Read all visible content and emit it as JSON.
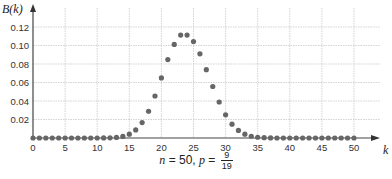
{
  "chart_data": {
    "type": "scatter",
    "title": "",
    "xlabel": "k",
    "ylabel": "B(k)",
    "caption": {
      "n_label": "n",
      "n_value": "= 50,",
      "p_label": "p",
      "p_eq": "=",
      "p_num": "9",
      "p_den": "19"
    },
    "xlim": [
      0,
      50
    ],
    "ylim": [
      0,
      0.12
    ],
    "grid": true,
    "x_ticks": [
      0,
      5,
      10,
      15,
      20,
      25,
      30,
      35,
      40,
      45,
      50
    ],
    "y_ticks": [
      0.02,
      0.04,
      0.06,
      0.08,
      0.1,
      0.12
    ],
    "y_tick_labels": [
      "0.02",
      "0.04",
      "0.06",
      "0.08",
      "0.10",
      "0.12"
    ],
    "series": [
      {
        "name": "Binomial B(k), n=50, p=9/19",
        "color": "#666666",
        "x": [
          0,
          1,
          2,
          3,
          4,
          5,
          6,
          7,
          8,
          9,
          10,
          11,
          12,
          13,
          14,
          15,
          16,
          17,
          18,
          19,
          20,
          21,
          22,
          23,
          24,
          25,
          26,
          27,
          28,
          29,
          30,
          31,
          32,
          33,
          34,
          35,
          36,
          37,
          38,
          39,
          40,
          41,
          42,
          43,
          44,
          45,
          46,
          47,
          48,
          49,
          50
        ],
        "values": [
          0,
          0,
          0,
          0,
          0,
          0,
          0,
          0,
          0,
          0,
          0,
          0.0001,
          0.0002,
          0.0006,
          0.0017,
          0.0041,
          0.0087,
          0.0167,
          0.0289,
          0.0454,
          0.065,
          0.0848,
          0.1012,
          0.1113,
          0.1113,
          0.1042,
          0.091,
          0.0739,
          0.0557,
          0.0389,
          0.0251,
          0.0149,
          0.0082,
          0.0041,
          0.0019,
          0.0008,
          0.0003,
          0.0001,
          0,
          0,
          0,
          0,
          0,
          0,
          0,
          0,
          0,
          0,
          0,
          0,
          0
        ]
      }
    ]
  }
}
